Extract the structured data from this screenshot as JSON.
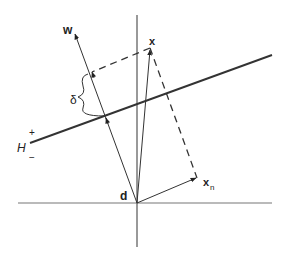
{
  "diagram": {
    "labels": {
      "w": "w",
      "x": "x",
      "xn_main": "x",
      "xn_sub": "n",
      "d": "d",
      "H": "H",
      "plus": "+",
      "minus": "−",
      "delta": "δ"
    },
    "colors": {
      "line": "#333333",
      "axis": "#666666",
      "text": "#222222"
    }
  }
}
